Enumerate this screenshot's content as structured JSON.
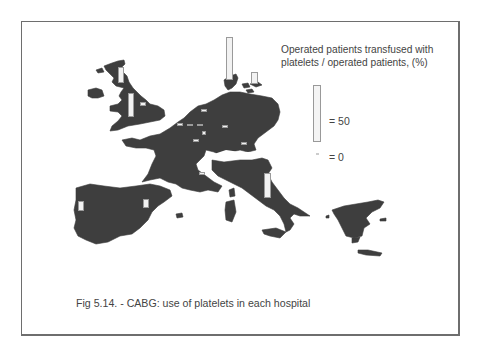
{
  "figure": {
    "caption": "Fig 5.14. - CABG: use of platelets in each hospital"
  },
  "legend": {
    "title_line1": "Operated patients transfused with",
    "title_line2": "platelets / operated patients,  (%)",
    "max_label": "= 50",
    "zero_label": "= 0"
  },
  "colors": {
    "land": "#3e3e3e",
    "bar_fill": "#f2f2f2",
    "bar_border": "#9a9a9a",
    "frame": "#6e6e6e"
  },
  "chart_data": {
    "type": "map-bar",
    "title": "Fig 5.14. - CABG: use of platelets in each hospital",
    "measure": "Operated patients transfused with platelets / operated patients (%)",
    "scale": {
      "legend_bar_value": 50,
      "legend_zero_value": 0
    },
    "region": "Western & Southern Europe",
    "hospitals": [
      {
        "location": "Scotland (UK)",
        "value": 14
      },
      {
        "location": "England (UK)",
        "value": 21
      },
      {
        "location": "England east (UK)",
        "value": 3
      },
      {
        "location": "Denmark",
        "value": 38
      },
      {
        "location": "Sweden (south)",
        "value": 10
      },
      {
        "location": "Netherlands",
        "value": 2
      },
      {
        "location": "Belgium 1",
        "value": 2
      },
      {
        "location": "Belgium 2",
        "value": 2
      },
      {
        "location": "Belgium 3",
        "value": 2
      },
      {
        "location": "Belgium/Luxembourg",
        "value": 3
      },
      {
        "location": "Germany (central)",
        "value": 2
      },
      {
        "location": "Germany (south)",
        "value": 2
      },
      {
        "location": "France (north)",
        "value": 2
      },
      {
        "location": "France (south-east)",
        "value": 2
      },
      {
        "location": "Italy",
        "value": 22
      },
      {
        "location": "Portugal",
        "value": 9
      },
      {
        "location": "Spain",
        "value": 8
      }
    ]
  },
  "bars": [
    {
      "x": 118,
      "y": 67,
      "w": 6,
      "h": 16
    },
    {
      "x": 128,
      "y": 93,
      "w": 6,
      "h": 24
    },
    {
      "x": 140,
      "y": 102,
      "w": 6,
      "h": 4
    },
    {
      "x": 226,
      "y": 37,
      "w": 7,
      "h": 43
    },
    {
      "x": 251,
      "y": 72,
      "w": 7,
      "h": 12
    },
    {
      "x": 201,
      "y": 109,
      "w": 6,
      "h": 3
    },
    {
      "x": 177,
      "y": 123,
      "w": 6,
      "h": 3
    },
    {
      "x": 187,
      "y": 124,
      "w": 6,
      "h": 2
    },
    {
      "x": 197,
      "y": 124,
      "w": 6,
      "h": 2
    },
    {
      "x": 202,
      "y": 131,
      "w": 4,
      "h": 4
    },
    {
      "x": 222,
      "y": 125,
      "w": 6,
      "h": 3
    },
    {
      "x": 241,
      "y": 142,
      "w": 6,
      "h": 3
    },
    {
      "x": 193,
      "y": 139,
      "w": 6,
      "h": 3
    },
    {
      "x": 199,
      "y": 172,
      "w": 6,
      "h": 3
    },
    {
      "x": 264,
      "y": 173,
      "w": 7,
      "h": 25
    },
    {
      "x": 78,
      "y": 201,
      "w": 6,
      "h": 10
    },
    {
      "x": 143,
      "y": 199,
      "w": 6,
      "h": 9
    }
  ]
}
